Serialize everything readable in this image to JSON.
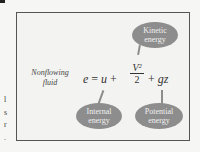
{
  "figure": {
    "label_line1": "Nonflowing",
    "label_line2": "fluid",
    "equation": {
      "lhs": "e",
      "eq": "=",
      "u": "u",
      "plus1": "+",
      "numerator": "V²",
      "denominator": "2",
      "plus2": "+",
      "gz": "gz"
    },
    "bubbles": {
      "kinetic_line1": "Kinetic",
      "kinetic_line2": "energy",
      "internal_line1": "Internal",
      "internal_line2": "energy",
      "potential_line1": "Potential",
      "potential_line2": "energy"
    },
    "edge_text": [
      "l",
      "s",
      "r",
      "."
    ]
  }
}
